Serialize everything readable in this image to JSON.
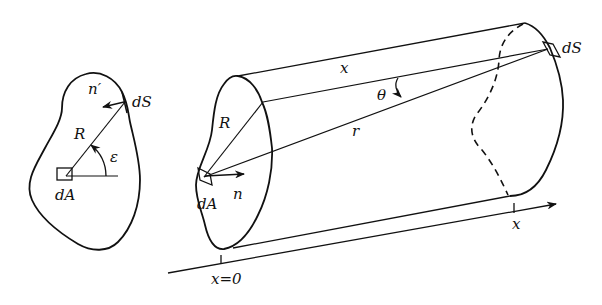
{
  "figure": {
    "left_panel": {
      "labels": {
        "normal": "n′",
        "surface_element": "dS",
        "distance": "R",
        "angle": "ε",
        "area_element": "dA"
      }
    },
    "right_panel": {
      "labels": {
        "axial_distance": "x",
        "angle": "θ",
        "radial_distance": "r",
        "distance": "R",
        "surface_element": "dS",
        "normal": "n",
        "area_element": "dA",
        "axis_origin": "x=0",
        "axis_position": "x"
      }
    },
    "colors": {
      "line": "#111111",
      "background": "#ffffff"
    }
  }
}
